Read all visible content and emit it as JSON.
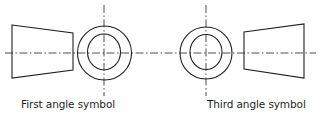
{
  "diagram": {
    "stroke_color": "#231f20",
    "background": "#ffffff",
    "symbols": [
      {
        "name": "first-angle",
        "label": "First angle symbol",
        "frustum_view": "left",
        "circle_view": "right"
      },
      {
        "name": "third-angle",
        "label": "Third angle symbol",
        "frustum_view": "right",
        "circle_view": "left"
      }
    ]
  }
}
